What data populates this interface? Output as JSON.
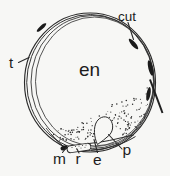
{
  "figure": {
    "kind": "scientific-line-drawing",
    "background_color": "#f7f7f5",
    "ink_color": "#2a2a2a",
    "labels": {
      "t": "t",
      "en": "en",
      "cut": "cut",
      "m": "m",
      "r": "r",
      "e": "e",
      "p": "p"
    }
  }
}
